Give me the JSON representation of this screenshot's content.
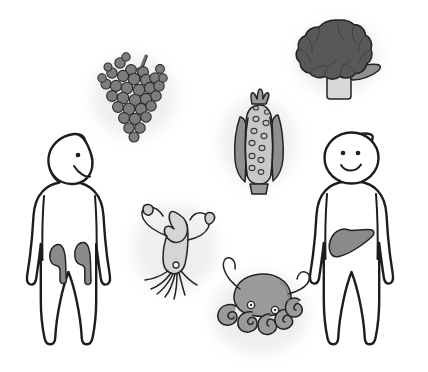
{
  "illustration": {
    "title": "Foods rich in purines and the organs they affect",
    "background_color": "#ffffff",
    "canvas": {
      "width": 428,
      "height": 372
    },
    "style": "hand-drawn grayscale line illustration with soft halo shadows",
    "palette": {
      "outline": "#1d1d1d",
      "body_fill": "#ffffff",
      "organ_gray": "#8a8a8a",
      "grape_gray": "#7d7d7d",
      "broccoli_dark": "#585858",
      "broccoli_stem": "#d8d8d8",
      "corn_cob": "#c8c8c8",
      "corn_husk": "#8f8f8f",
      "squid_light": "#d5d5d5",
      "octopus_gray": "#9a9a9a",
      "halo_gray": "#e8e8e8"
    }
  },
  "figures": [
    {
      "id": "left-person",
      "label": "Person shown in three-quarter view facing right",
      "facing": "right",
      "eyes": 1,
      "mouth": "smile",
      "organ": {
        "name": "kidneys",
        "count": 2,
        "color": "#8a8a8a",
        "position": "lower abdomen"
      },
      "bbox": {
        "x": 22,
        "y": 133,
        "width": 112,
        "height": 212
      }
    },
    {
      "id": "right-person",
      "label": "Person shown front-facing",
      "facing": "front",
      "eyes": 2,
      "mouth": "smile",
      "organ": {
        "name": "liver",
        "count": 1,
        "color": "#8a8a8a",
        "position": "upper right abdomen"
      },
      "bbox": {
        "x": 310,
        "y": 133,
        "width": 110,
        "height": 212
      }
    }
  ],
  "food_items": [
    {
      "id": "grapes",
      "label": "Bunch of grapes",
      "category": "fruit",
      "fill_color": "#7d7d7d",
      "berry_count": 34,
      "has_stem": true,
      "bbox": {
        "x": 100,
        "y": 50,
        "width": 72,
        "height": 95
      }
    },
    {
      "id": "broccoli",
      "label": "Broccoli floret",
      "category": "vegetable",
      "fill_color": "#585858",
      "stem_color": "#d8d8d8",
      "has_leaf": true,
      "bbox": {
        "x": 300,
        "y": 18,
        "width": 78,
        "height": 82
      }
    },
    {
      "id": "corn",
      "label": "Ear of corn with husk",
      "category": "vegetable",
      "cob_color": "#c8c8c8",
      "husk_color": "#8f8f8f",
      "kernel_count": 12,
      "bbox": {
        "x": 228,
        "y": 95,
        "width": 62,
        "height": 95
      }
    },
    {
      "id": "squid",
      "label": "Squid",
      "category": "seafood",
      "fill_color": "#d5d5d5",
      "tentacle_count": 2,
      "bbox": {
        "x": 135,
        "y": 200,
        "width": 80,
        "height": 100
      }
    },
    {
      "id": "octopus",
      "label": "Octopus",
      "category": "seafood",
      "fill_color": "#9a9a9a",
      "tentacle_count": 8,
      "bbox": {
        "x": 210,
        "y": 270,
        "width": 100,
        "height": 90
      }
    }
  ]
}
